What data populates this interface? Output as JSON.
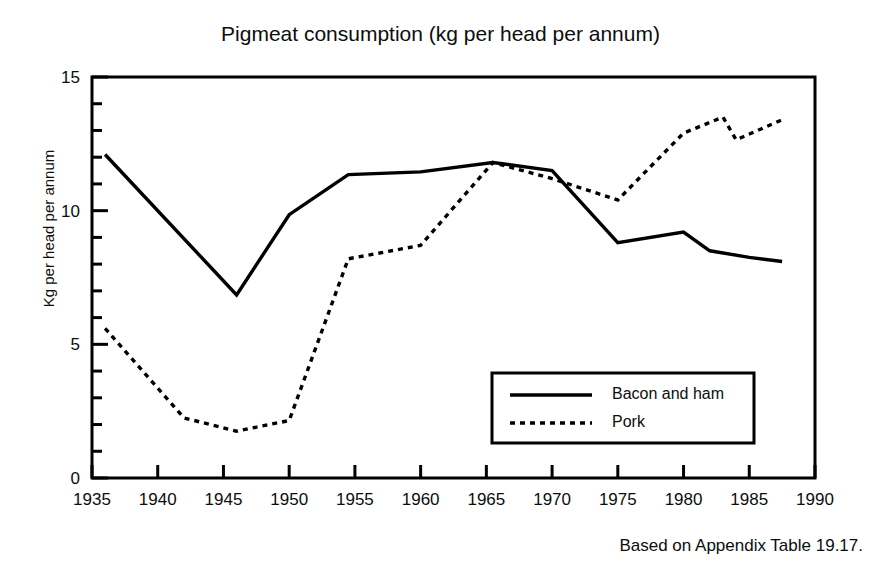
{
  "chart_data": {
    "type": "line",
    "title": "Pigmeat consumption (kg per head per annum)",
    "xlabel": "",
    "ylabel": "Kg per head per annum",
    "xlim": [
      1935,
      1990
    ],
    "ylim": [
      0,
      15
    ],
    "xticks": [
      1935,
      1940,
      1945,
      1950,
      1955,
      1960,
      1965,
      1970,
      1975,
      1980,
      1985,
      1990
    ],
    "yticks": [
      0,
      5,
      10,
      15
    ],
    "y_minor_tick_step": 1,
    "grid": false,
    "legend_position": "lower-right-inside",
    "source_note": "Based on Appendix Table 19.17.",
    "series": [
      {
        "name": "Bacon and ham",
        "style": "solid",
        "color": "#000000",
        "x": [
          1936,
          1946,
          1950,
          1954.5,
          1960,
          1965.5,
          1970,
          1975,
          1980,
          1982,
          1985,
          1987.5
        ],
        "values": [
          12.1,
          6.85,
          9.85,
          11.35,
          11.45,
          11.8,
          11.5,
          8.8,
          9.2,
          8.5,
          8.25,
          8.1
        ]
      },
      {
        "name": "Pork",
        "style": "dotted",
        "color": "#000000",
        "x": [
          1936,
          1942,
          1946,
          1950,
          1954.5,
          1960,
          1965.5,
          1970,
          1975,
          1980,
          1983,
          1984,
          1987.5
        ],
        "values": [
          5.6,
          2.25,
          1.75,
          2.15,
          8.2,
          8.7,
          11.8,
          11.2,
          10.4,
          12.9,
          13.5,
          12.65,
          13.4
        ]
      }
    ]
  },
  "title": {
    "text": "Pigmeat consumption (kg per head per annum)"
  },
  "axes": {
    "y_label": "Kg per head per annum",
    "x_tick_labels": [
      "1935",
      "1940",
      "1945",
      "1950",
      "1955",
      "1960",
      "1965",
      "1970",
      "1975",
      "1980",
      "1985",
      "1990"
    ],
    "y_tick_labels": [
      "0",
      "5",
      "10",
      "15"
    ]
  },
  "legend": {
    "items": [
      {
        "label": "Bacon and ham",
        "style": "solid"
      },
      {
        "label": "Pork",
        "style": "dotted"
      }
    ]
  },
  "footer": {
    "note": "Based on Appendix Table 19.17."
  }
}
